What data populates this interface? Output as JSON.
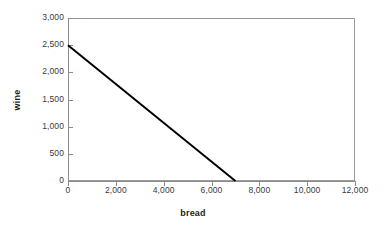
{
  "chart_data": {
    "type": "line",
    "title": "",
    "xlabel": "bread",
    "ylabel": "wine",
    "xlim": [
      0,
      12000
    ],
    "ylim": [
      0,
      3000
    ],
    "grid": false,
    "legend": false,
    "legend_position": "none",
    "x_ticks": [
      0,
      2000,
      4000,
      6000,
      8000,
      10000,
      12000
    ],
    "x_tick_labels": [
      "0",
      "2,000",
      "4,000",
      "6,000",
      "8,000",
      "10,000",
      "12,000"
    ],
    "y_ticks": [
      0,
      500,
      1000,
      1500,
      2000,
      2500,
      3000
    ],
    "y_tick_labels": [
      "0",
      "500",
      "1,000",
      "1,500",
      "2,000",
      "2,500",
      "3,000"
    ],
    "series": [
      {
        "name": "budget line",
        "x": [
          0,
          7000
        ],
        "y": [
          2500,
          0
        ],
        "color": "#000000",
        "line_width": 2
      }
    ],
    "annotations": []
  },
  "style": {
    "plot_background": "#ffffff",
    "frame_color": "#9a9a9a",
    "axis_color": "#8c8c8c",
    "tick_label_color": "#3a3a3a",
    "title_color": "#231f20"
  }
}
